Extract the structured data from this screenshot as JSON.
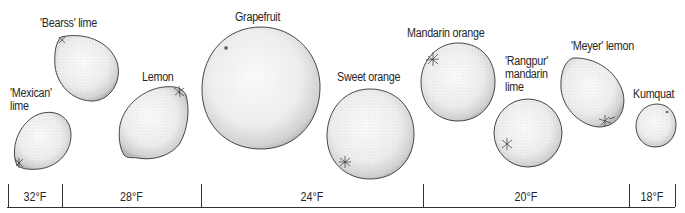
{
  "diagram": {
    "type": "citrus cold-hardiness scale",
    "fruits": [
      {
        "name": "'Mexican' lime",
        "lines": [
          "'Mexican'",
          "lime"
        ],
        "shape": "lime"
      },
      {
        "name": "'Bearss' lime",
        "lines": [
          "'Bearss' lime"
        ],
        "shape": "oval"
      },
      {
        "name": "Lemon",
        "lines": [
          "Lemon"
        ],
        "shape": "lemon"
      },
      {
        "name": "Grapefruit",
        "lines": [
          "Grapefruit"
        ],
        "shape": "round"
      },
      {
        "name": "Sweet orange",
        "lines": [
          "Sweet orange"
        ],
        "shape": "round"
      },
      {
        "name": "Mandarin orange",
        "lines": [
          "Mandarin orange"
        ],
        "shape": "round"
      },
      {
        "name": "'Rangpur' mandarin lime",
        "lines": [
          "'Rangpur'",
          "mandarin",
          "lime"
        ],
        "shape": "round"
      },
      {
        "name": "'Meyer' lemon",
        "lines": [
          "'Meyer' lemon"
        ],
        "shape": "oval"
      },
      {
        "name": "Kumquat",
        "lines": [
          "Kumquat"
        ],
        "shape": "round"
      }
    ],
    "temperature_scale": [
      {
        "label": "32°F",
        "fruits": [
          "'Mexican' lime"
        ]
      },
      {
        "label": "28°F",
        "fruits": [
          "'Bearss' lime",
          "Lemon"
        ]
      },
      {
        "label": "24°F",
        "fruits": [
          "Grapefruit",
          "Sweet orange"
        ]
      },
      {
        "label": "20°F",
        "fruits": [
          "Mandarin orange",
          "'Rangpur' mandarin lime",
          "'Meyer' lemon"
        ]
      },
      {
        "label": "18°F",
        "fruits": [
          "Kumquat"
        ]
      }
    ],
    "colors": {
      "outline": "#333333",
      "stipple": "#9a9a9a",
      "background": "#ffffff"
    }
  }
}
